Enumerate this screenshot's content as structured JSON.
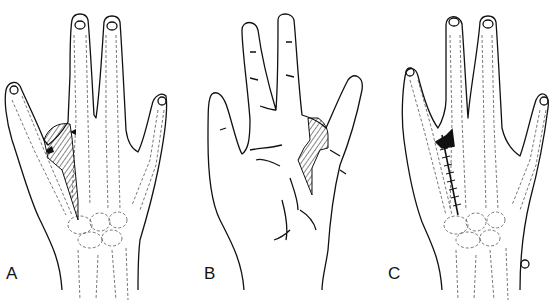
{
  "figure": {
    "panels": [
      {
        "label": "A",
        "description": "Dorsal hand skeleton with hatched flap outlined between index and middle metacarpals"
      },
      {
        "label": "B",
        "description": "Palmar hand surface with hatched zig-zag flap at index web"
      },
      {
        "label": "C",
        "description": "Dorsal hand skeleton with sutured incision after flap closure"
      }
    ],
    "colors": {
      "line": "#111111",
      "bone": "#555555",
      "background": "#ffffff"
    }
  }
}
